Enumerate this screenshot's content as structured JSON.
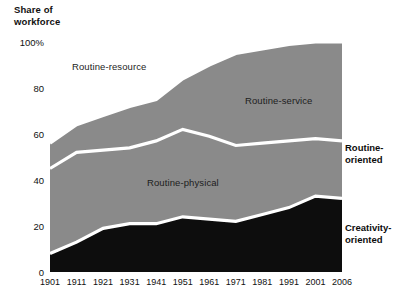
{
  "axis_title": {
    "line1": "Share of",
    "line2": "workforce"
  },
  "legend": {
    "routine": {
      "line1": "Routine-",
      "line2": "oriented"
    },
    "creativity": {
      "line1": "Creativity-",
      "line2": "oriented"
    }
  },
  "series_labels": {
    "routine_resource": "Routine-resource",
    "routine_service": "Routine-service",
    "routine_physical": "Routine-physical"
  },
  "colors": {
    "area_grey": "#8a8a8a",
    "area_black": "#0d0d0d",
    "separator": "#ffffff",
    "text": "#111111",
    "background": "#ffffff"
  },
  "chart_data": {
    "type": "area",
    "title": "",
    "subtitle": "",
    "xlabel": "",
    "ylabel": "Share of workforce",
    "ylim": [
      0,
      100
    ],
    "xlim": [
      1901,
      2006
    ],
    "grid": false,
    "legend_position": "right",
    "stacked": true,
    "units": "percent",
    "categories": [
      1901,
      1911,
      1921,
      1931,
      1941,
      1951,
      1961,
      1971,
      1981,
      1991,
      2001,
      2006
    ],
    "xtick_labels": [
      "1901",
      "1911",
      "1921",
      "1931",
      "1941",
      "1951",
      "1961",
      "1971",
      "1981",
      "1991",
      "2001",
      "2006"
    ],
    "ytick_values": [
      0,
      20,
      40,
      60,
      80,
      100
    ],
    "ytick_labels": [
      "0",
      "20",
      "40",
      "60",
      "80",
      "100%"
    ],
    "series": [
      {
        "name": "Creativity-oriented",
        "fill": "#0d0d0d",
        "values": [
          8,
          13,
          19,
          21,
          21,
          24,
          23,
          22,
          25,
          28,
          33,
          32
        ]
      },
      {
        "name": "Routine-physical",
        "fill": "#8a8a8a",
        "values": [
          37,
          39,
          34,
          33,
          36,
          38,
          36,
          33,
          31,
          29,
          25,
          25
        ]
      },
      {
        "name": "Routine-resource",
        "fill": "#8a8a8a",
        "values": [
          11,
          12,
          15,
          18,
          18,
          22,
          31,
          40,
          41,
          42,
          42,
          43
        ]
      },
      {
        "name": "Routine-service",
        "fill": "#8a8a8a",
        "values": [
          44,
          36,
          32,
          28,
          25,
          16,
          10,
          5,
          3,
          1,
          0,
          0
        ]
      }
    ],
    "cumulative_boundaries": {
      "creativity_top": [
        8,
        13,
        19,
        21,
        21,
        24,
        23,
        22,
        25,
        28,
        33,
        32
      ],
      "routine_physical_top": [
        45,
        52,
        53,
        54,
        57,
        62,
        59,
        55,
        56,
        57,
        58,
        57
      ],
      "routine_resource_top": [
        56,
        64,
        68,
        72,
        75,
        84,
        90,
        95,
        97,
        99,
        100,
        100
      ]
    }
  }
}
